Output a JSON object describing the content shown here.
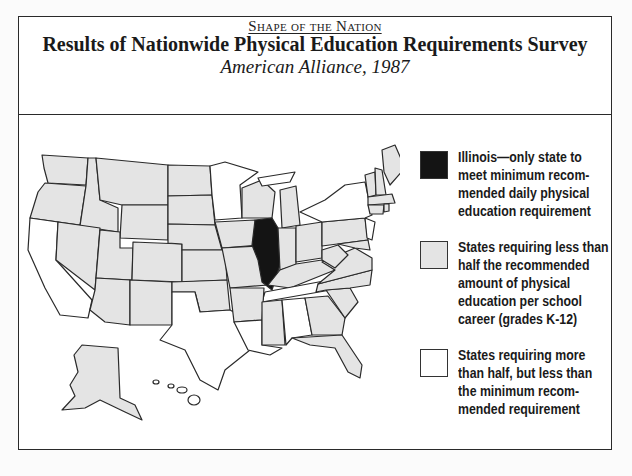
{
  "header": {
    "kicker": "Shape of the Nation",
    "title": "Results of Nationwide Physical Education Requirements Survey",
    "subtitle": "American Alliance, 1987"
  },
  "colors": {
    "illinois": "#141414",
    "less_than_half": "#e4e4e4",
    "more_than_half": "#ffffff",
    "border": "#2a2a2a"
  },
  "legend": [
    {
      "swatch": "black",
      "label": "Illinois—only state to meet minimum recommended daily physical education requirement",
      "lines": [
        "Illinois—only state to",
        "meet minimum recom-",
        "mended daily physical",
        "education requirement"
      ]
    },
    {
      "swatch": "gray",
      "label": "States requiring less than half the recommended amount of physical education per school career (grades K-12)",
      "lines": [
        "States requiring less than",
        "half the recommended",
        "amount of physical",
        "education per school",
        "career (grades K-12)"
      ]
    },
    {
      "swatch": "white",
      "label": "States requiring more than half, but less than the minimum recommended requirement",
      "lines": [
        "States requiring more",
        "than half, but less than",
        "the minimum recom-",
        "mended requirement"
      ]
    }
  ],
  "map": {
    "black_states": [
      "Illinois"
    ],
    "white_states": [
      "California",
      "Texas",
      "Louisiana",
      "Alabama",
      "Tennessee",
      "Minnesota",
      "New York",
      "Michigan (Upper Peninsula)",
      "Hawaii"
    ],
    "gray_states": "all others"
  }
}
